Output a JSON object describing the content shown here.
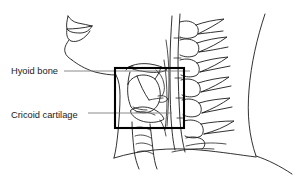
{
  "figure": {
    "kind": "anatomical-line-drawing",
    "background_color": "#ffffff",
    "line_color": "#1b1b1b",
    "leader_color": "#7d7d7d",
    "roi_box_color": "#000000",
    "width": 297,
    "height": 192
  },
  "labels": [
    {
      "id": "hyoid-bone",
      "text": "Hyoid bone",
      "text_x": 11,
      "text_y": 74,
      "leader_from_x": 64,
      "leader_from_y": 71,
      "leader_to_x": 190,
      "leader_to_y": 71
    },
    {
      "id": "cricoid-cartilage",
      "text": "Cricoid cartilage",
      "text_x": 11,
      "text_y": 118,
      "leader_from_x": 88,
      "leader_from_y": 113,
      "leader_to_x": 172,
      "leader_to_y": 113
    }
  ],
  "roi_box": {
    "id": "region-of-interest",
    "x": 115,
    "y": 68,
    "width": 69,
    "height": 60
  }
}
